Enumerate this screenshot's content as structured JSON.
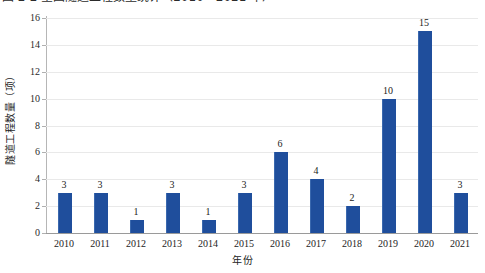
{
  "caption": {
    "text": "图 2-2  全国隧道工程数量统计（2010—2021 年）"
  },
  "chart_data": {
    "type": "bar",
    "title": "",
    "xlabel": "年份",
    "ylabel": "隧道工程数量（项）",
    "categories": [
      "2010",
      "2011",
      "2012",
      "2013",
      "2014",
      "2015",
      "2016",
      "2017",
      "2018",
      "2019",
      "2020",
      "2021"
    ],
    "values": [
      3,
      3,
      1,
      3,
      1,
      3,
      6,
      4,
      2,
      10,
      15,
      3
    ],
    "ylim": [
      0,
      16
    ],
    "yticks": [
      0,
      2,
      4,
      6,
      8,
      10,
      12,
      14,
      16
    ],
    "ytick_labels": [
      "0",
      "2",
      "4",
      "6",
      "8",
      "10",
      "12",
      "14",
      "16"
    ],
    "data_labels": [
      "3",
      "3",
      "1",
      "3",
      "1",
      "3",
      "6",
      "4",
      "2",
      "10",
      "15",
      "3"
    ],
    "grid": true,
    "grid_axis": "y",
    "legend": false,
    "series": [
      {
        "name": "隧道工程数量",
        "values": [
          3,
          3,
          1,
          3,
          1,
          3,
          6,
          4,
          2,
          10,
          15,
          3
        ],
        "color": "#1F4E9C"
      }
    ]
  },
  "colors": {
    "bar": "#1F4E9C",
    "bar_edge": "#3A68AE",
    "gridline": "#E9E9E9",
    "axis": "#9A9A9A",
    "text": "#232323",
    "background": "#FFFFFF"
  }
}
